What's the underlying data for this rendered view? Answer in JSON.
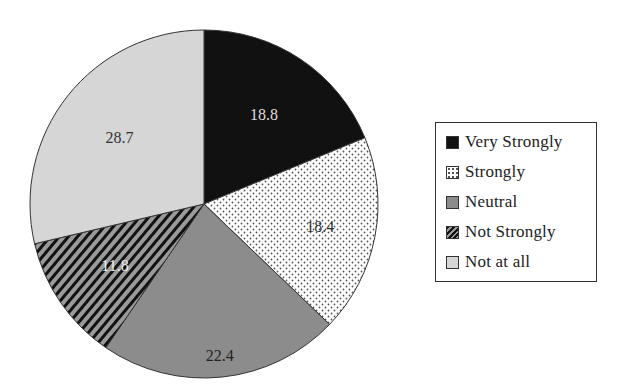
{
  "chart_data": {
    "type": "pie",
    "title": "",
    "unit": "%",
    "categories": [
      "Very Strongly",
      "Strongly",
      "Neutral",
      "Not Strongly",
      "Not at all"
    ],
    "values": [
      18.8,
      18.4,
      22.4,
      11.8,
      28.7
    ],
    "labels": [
      "18.8",
      "18.4",
      "22.4",
      "11.8",
      "28.7"
    ],
    "start_angle": "12 o'clock",
    "direction": "clockwise",
    "fills": [
      {
        "name": "Very Strongly",
        "pattern": "solid",
        "color": "#111111"
      },
      {
        "name": "Strongly",
        "pattern": "dots",
        "color": "#ffffff",
        "dot_color": "#555555"
      },
      {
        "name": "Neutral",
        "pattern": "solid",
        "color": "#8c8c8c"
      },
      {
        "name": "Not Strongly",
        "pattern": "diagonal-stripes",
        "color": "#9a9a9a",
        "stripe_color": "#111111"
      },
      {
        "name": "Not at all",
        "pattern": "solid",
        "color": "#d6d6d6"
      }
    ],
    "label_colors": [
      "#dddddd",
      "#333333",
      "#222222",
      "#eeeeee",
      "#333333"
    ],
    "legend_position": "right"
  },
  "legend": {
    "items": [
      {
        "label": "Very Strongly"
      },
      {
        "label": "Strongly"
      },
      {
        "label": "Neutral"
      },
      {
        "label": "Not Strongly"
      },
      {
        "label": "Not at all"
      }
    ]
  }
}
